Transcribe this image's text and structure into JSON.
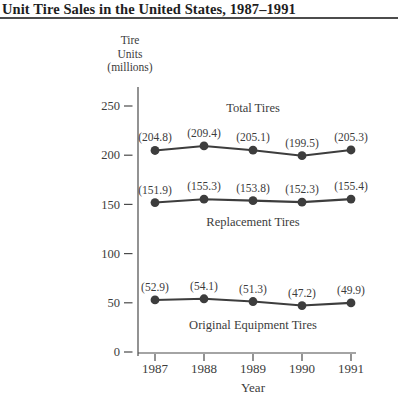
{
  "header": {
    "title": "Unit Tire Sales in the United States, 1987–1991"
  },
  "y_axis_label": {
    "lines": [
      "Tire",
      "Units",
      "(millions)"
    ]
  },
  "chart_data": {
    "type": "line",
    "title": "Unit Tire Sales in the United States, 1987–1991",
    "x": [
      1987,
      1988,
      1989,
      1990,
      1991
    ],
    "xlabel": "Year",
    "ylabel": "Tire Units (millions)",
    "ylim": [
      0,
      250
    ],
    "yticks": [
      0,
      50,
      100,
      150,
      200,
      250
    ],
    "grid": false,
    "legend": "inline-series-labels",
    "marker": "filled-circle",
    "series": [
      {
        "name": "Total Tires",
        "values": [
          204.8,
          209.4,
          205.1,
          199.5,
          205.3
        ],
        "point_labels": [
          "(204.8)",
          "(209.4)",
          "(205.1)",
          "(199.5)",
          "(205.3)"
        ],
        "name_placement": "above"
      },
      {
        "name": "Replacement Tires",
        "values": [
          151.9,
          155.3,
          153.8,
          152.3,
          155.4
        ],
        "point_labels": [
          "(151.9)",
          "(155.3)",
          "(153.8)",
          "(152.3)",
          "(155.4)"
        ],
        "name_placement": "below"
      },
      {
        "name": "Original Equipment Tires",
        "values": [
          52.9,
          54.1,
          51.3,
          47.2,
          49.9
        ],
        "point_labels": [
          "(52.9)",
          "(54.1)",
          "(51.3)",
          "(47.2)",
          "(49.9)"
        ],
        "name_placement": "below"
      }
    ]
  },
  "colors": {
    "background": "#ffffff",
    "title_ink": "#1e1e1e",
    "rule": "#4c4c4c",
    "axis": "#4a4a4a",
    "series_ink": "#3d3d3d",
    "text_ink": "#3c3c3c"
  }
}
